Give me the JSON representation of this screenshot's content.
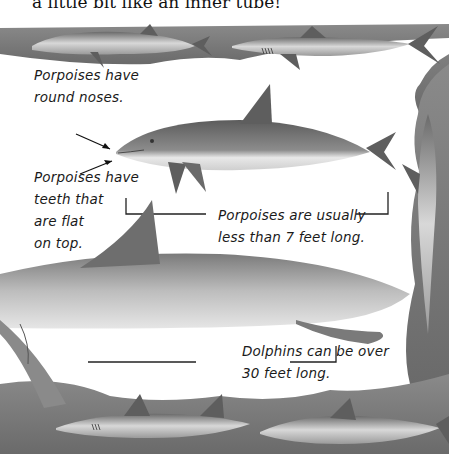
{
  "page": {
    "intro_text": "a little bit like an inner tube!"
  },
  "labels": {
    "round_noses": [
      "Porpoises have",
      "round noses."
    ],
    "flat_teeth": [
      "Porpoises have",
      "teeth that",
      "are flat",
      "on top."
    ],
    "porpoise_length": [
      "Porpoises are usually",
      "less than 7 feet long."
    ],
    "dolphin_length": [
      "Dolphins can be over",
      "30 feet long."
    ]
  },
  "illustration": {
    "colors": {
      "border": "#6f6f6f",
      "porpoise": "#7a7a7a",
      "dolphin": "#9a9a9a",
      "fin": "#5e5e5e",
      "paper": "#ffffff"
    }
  }
}
